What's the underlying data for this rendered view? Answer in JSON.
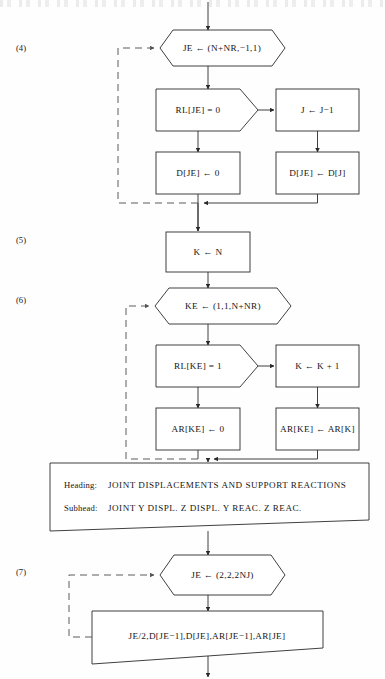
{
  "page": {
    "width": 385,
    "height": 679,
    "background_color": "#fefefe",
    "line_color": "#2a2a2a",
    "dashed_line_color": "#555555"
  },
  "header": {
    "text": ""
  },
  "step_labels": [
    {
      "id": "step-4",
      "text": "(4)"
    },
    {
      "id": "step-5",
      "text": "(5)"
    },
    {
      "id": "step-6",
      "text": "(6)"
    },
    {
      "id": "step-7",
      "text": "(7)"
    }
  ],
  "nodes": {
    "loop_je_reverse": {
      "shape": "hexagon",
      "text": "JE ← (N+NR,−1,1)"
    },
    "decision_rl_je": {
      "shape": "pentagon-decision",
      "text": "RL[JE] = 0"
    },
    "assign_j_minus": {
      "shape": "rectangle",
      "text": "J ← J−1"
    },
    "assign_d_je_zero": {
      "shape": "rectangle",
      "text": "D[JE] ← 0"
    },
    "assign_d_je_dj": {
      "shape": "rectangle",
      "text": "D[JE] ← D[J]"
    },
    "assign_k_n": {
      "shape": "rectangle",
      "text": "K ← N"
    },
    "loop_ke_forward": {
      "shape": "hexagon",
      "text": "KE ← (1,1,N+NR)"
    },
    "decision_rl_ke": {
      "shape": "pentagon-decision",
      "text": "RL[KE] = 1"
    },
    "assign_k_plus": {
      "shape": "rectangle",
      "text": "K ← K + 1"
    },
    "assign_ar_ke_zero": {
      "shape": "rectangle",
      "text": "AR[KE] ← 0"
    },
    "assign_ar_ke_ark": {
      "shape": "rectangle",
      "text": "AR[KE] ← AR[K]"
    },
    "output_headings": {
      "shape": "trapezoid-output",
      "heading_label": "Heading:",
      "heading_value": "JOINT DISPLACEMENTS AND SUPPORT REACTIONS",
      "subhead_label": "Subhead:",
      "subhead_value": "JOINT   Y DISPL.   Z DISPL.   Y REAC.   Z REAC."
    },
    "loop_je_pairs": {
      "shape": "hexagon",
      "text": "JE ← (2,2,2NJ)"
    },
    "output_values": {
      "shape": "trapezoid-output",
      "text": "JE/2,D[JE−1],D[JE],AR[JE−1],AR[JE]"
    }
  },
  "connectors": [
    {
      "id": "entry-arrow",
      "from": "top-edge",
      "to": "loop_je_reverse",
      "style": "solid"
    },
    {
      "id": "loop4-to-decision",
      "from": "loop_je_reverse",
      "to": "decision_rl_je",
      "style": "solid"
    },
    {
      "id": "decision4-false-right",
      "from": "decision_rl_je",
      "to": "assign_j_minus",
      "style": "solid"
    },
    {
      "id": "decision4-true-down",
      "from": "decision_rl_je",
      "to": "assign_d_je_zero",
      "style": "solid"
    },
    {
      "id": "jminus-to-djedj",
      "from": "assign_j_minus",
      "to": "assign_d_je_dj",
      "style": "solid"
    },
    {
      "id": "merge4-left",
      "from": "assign_d_je_zero",
      "to": "merge-bar-4",
      "style": "solid"
    },
    {
      "id": "merge4-right",
      "from": "assign_d_je_dj",
      "to": "merge-bar-4",
      "style": "solid"
    },
    {
      "id": "loopback4",
      "from": "merge-bar-4",
      "to": "loop_je_reverse",
      "style": "dashed"
    },
    {
      "id": "merge4-to-kn",
      "from": "merge-bar-4",
      "to": "assign_k_n",
      "style": "solid"
    },
    {
      "id": "kn-to-loop6",
      "from": "assign_k_n",
      "to": "loop_ke_forward",
      "style": "solid"
    },
    {
      "id": "loop6-to-decision",
      "from": "loop_ke_forward",
      "to": "decision_rl_ke",
      "style": "solid"
    },
    {
      "id": "decision6-false-right",
      "from": "decision_rl_ke",
      "to": "assign_k_plus",
      "style": "solid"
    },
    {
      "id": "decision6-true-down",
      "from": "decision_rl_ke",
      "to": "assign_ar_ke_zero",
      "style": "solid"
    },
    {
      "id": "kplus-to-arke",
      "from": "assign_k_plus",
      "to": "assign_ar_ke_ark",
      "style": "solid"
    },
    {
      "id": "merge6-left",
      "from": "assign_ar_ke_zero",
      "to": "merge-bar-6",
      "style": "solid"
    },
    {
      "id": "merge6-right",
      "from": "assign_ar_ke_ark",
      "to": "merge-bar-6",
      "style": "solid"
    },
    {
      "id": "loopback6",
      "from": "merge-bar-6",
      "to": "loop_ke_forward",
      "style": "dashed"
    },
    {
      "id": "merge6-to-output",
      "from": "merge-bar-6",
      "to": "output_headings",
      "style": "solid"
    },
    {
      "id": "output-to-loop7",
      "from": "output_headings",
      "to": "loop_je_pairs",
      "style": "solid"
    },
    {
      "id": "loop7-to-output",
      "from": "loop_je_pairs",
      "to": "output_values",
      "style": "solid"
    },
    {
      "id": "loopback7",
      "from": "output_values",
      "to": "loop_je_pairs",
      "style": "dashed"
    },
    {
      "id": "exit-arrow",
      "from": "output_values",
      "to": "bottom-edge",
      "style": "solid"
    }
  ]
}
